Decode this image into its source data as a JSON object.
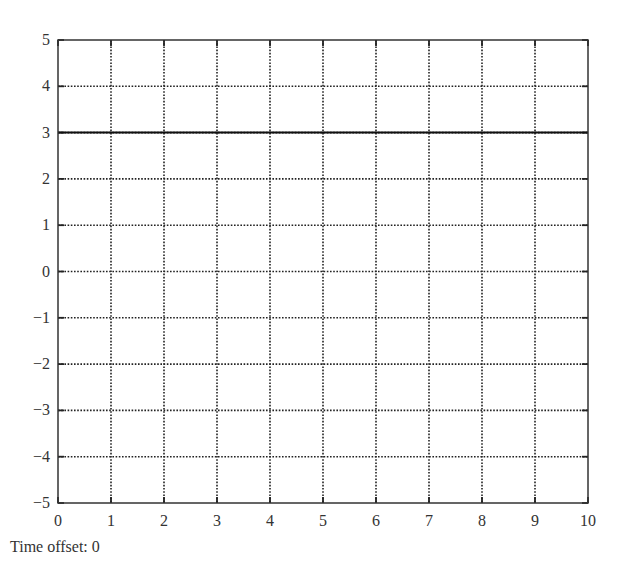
{
  "chart_data": {
    "type": "line",
    "title": "",
    "xlabel": "",
    "ylabel": "",
    "xlim": [
      0,
      10
    ],
    "ylim": [
      -5,
      5
    ],
    "x_ticks": [
      0,
      1,
      2,
      3,
      4,
      5,
      6,
      7,
      8,
      9,
      10
    ],
    "y_ticks": [
      -5,
      -4,
      -3,
      -2,
      -1,
      0,
      1,
      2,
      3,
      4,
      5
    ],
    "x_tick_labels": [
      "0",
      "1",
      "2",
      "3",
      "4",
      "5",
      "6",
      "7",
      "8",
      "9",
      "10"
    ],
    "y_tick_labels": [
      "−5",
      "−4",
      "−3",
      "−2",
      "−1",
      "0",
      "1",
      "2",
      "3",
      "4",
      "5"
    ],
    "grid": true,
    "grid_style": "dotted",
    "legend": null,
    "series": [
      {
        "name": "signal",
        "x": [
          0,
          10
        ],
        "y": [
          3,
          3
        ],
        "style": "solid",
        "color": "#111111"
      }
    ]
  },
  "caption": {
    "label": "Time offset:",
    "value": "0",
    "text": "Time offset: 0"
  },
  "colors": {
    "axis": "#333333",
    "grid": "#222222",
    "line": "#111111",
    "background": "#ffffff"
  }
}
